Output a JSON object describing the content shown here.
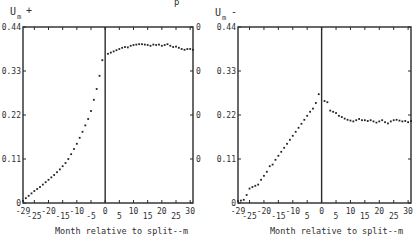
{
  "header_fragment": "p",
  "chart_data": [
    {
      "type": "scatter",
      "title": "",
      "ylabel": "U_m +",
      "ylabel_main": "U",
      "ylabel_sub": "m",
      "ylabel_sign": "+",
      "xlabel": "Month relative to split--m",
      "xlim": [
        -29,
        31
      ],
      "ylim": [
        0,
        0.44
      ],
      "yticks": [
        "0",
        "0.11",
        "0.22",
        "0.33",
        "0.44"
      ],
      "xticks": [
        "-29",
        "-25",
        "-20",
        "-15",
        "-10",
        "-5",
        "0",
        "5",
        "10",
        "15",
        "20",
        "25",
        "30"
      ],
      "right_axis_labels": [
        "0",
        "0",
        "0",
        "0"
      ],
      "vertical_line_at": 0,
      "grid": false,
      "x": [
        -29,
        -28,
        -27,
        -26,
        -25,
        -24,
        -23,
        -22,
        -21,
        -20,
        -19,
        -18,
        -17,
        -16,
        -15,
        -14,
        -13,
        -12,
        -11,
        -10,
        -9,
        -8,
        -7,
        -6,
        -5,
        -4,
        -3,
        -2,
        -1,
        1,
        2,
        3,
        4,
        5,
        6,
        7,
        8,
        9,
        10,
        11,
        12,
        13,
        14,
        15,
        16,
        17,
        18,
        19,
        20,
        21,
        22,
        23,
        24,
        25,
        26,
        27,
        28,
        29,
        30,
        31
      ],
      "values": [
        0.005,
        0.012,
        0.018,
        0.024,
        0.03,
        0.035,
        0.04,
        0.046,
        0.052,
        0.058,
        0.064,
        0.07,
        0.077,
        0.084,
        0.092,
        0.1,
        0.11,
        0.122,
        0.135,
        0.148,
        0.163,
        0.178,
        0.194,
        0.21,
        0.23,
        0.258,
        0.285,
        0.318,
        0.357,
        0.373,
        0.376,
        0.379,
        0.382,
        0.385,
        0.388,
        0.39,
        0.389,
        0.393,
        0.395,
        0.396,
        0.397,
        0.397,
        0.396,
        0.395,
        0.393,
        0.396,
        0.395,
        0.396,
        0.393,
        0.395,
        0.397,
        0.393,
        0.39,
        0.391,
        0.388,
        0.385,
        0.383,
        0.385,
        0.385,
        0.383
      ]
    },
    {
      "type": "scatter",
      "title": "",
      "ylabel": "U_m -",
      "ylabel_main": "U",
      "ylabel_sub": "m",
      "ylabel_sign": "-",
      "xlabel": "Month relative to split--m",
      "xlim": [
        -29,
        31
      ],
      "ylim": [
        0,
        0.44
      ],
      "yticks": [
        "0",
        "0.11",
        "0.22",
        "0.33",
        "0.44"
      ],
      "xticks": [
        "-29",
        "-25",
        "-20",
        "-15",
        "-10",
        "5",
        "0",
        "5",
        "10",
        "15",
        "20",
        "25",
        "30"
      ],
      "vertical_line_at": 0,
      "grid": false,
      "x": [
        -29,
        -28,
        -27,
        -26,
        -25,
        -24,
        -23,
        -22,
        -21,
        -20,
        -19,
        -18,
        -17,
        -16,
        -15,
        -14,
        -13,
        -12,
        -11,
        -10,
        -9,
        -8,
        -7,
        -6,
        -5,
        -4,
        -3,
        -2,
        -1,
        1,
        2,
        3,
        4,
        5,
        6,
        7,
        8,
        9,
        10,
        11,
        12,
        13,
        14,
        15,
        16,
        17,
        18,
        19,
        20,
        21,
        22,
        23,
        24,
        25,
        26,
        27,
        28,
        29,
        30,
        31
      ],
      "values": [
        0.005,
        0.006,
        0.008,
        0.02,
        0.036,
        0.04,
        0.043,
        0.046,
        0.058,
        0.068,
        0.078,
        0.092,
        0.096,
        0.108,
        0.118,
        0.128,
        0.138,
        0.148,
        0.158,
        0.168,
        0.178,
        0.188,
        0.198,
        0.208,
        0.218,
        0.228,
        0.236,
        0.25,
        0.272,
        0.255,
        0.252,
        0.231,
        0.228,
        0.225,
        0.218,
        0.215,
        0.211,
        0.208,
        0.206,
        0.204,
        0.207,
        0.21,
        0.207,
        0.207,
        0.205,
        0.207,
        0.204,
        0.201,
        0.204,
        0.207,
        0.202,
        0.199,
        0.204,
        0.207,
        0.208,
        0.206,
        0.204,
        0.205,
        0.202,
        0.205
      ]
    }
  ]
}
